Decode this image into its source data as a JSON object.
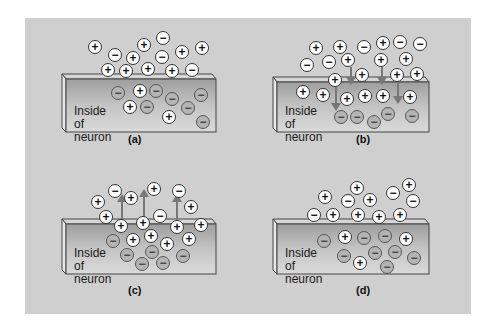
{
  "figure": {
    "background_color": "#cfcfcf",
    "membrane_color": "#b9b9b9",
    "arrow_color": "#777777"
  },
  "panels": [
    {
      "id": "a",
      "caption": "(a)",
      "inside_label_line1": "Inside",
      "inside_label_line2": "of neuron",
      "membrane": {
        "x": 66,
        "y": 77,
        "w": 146,
        "h": 54
      },
      "caption_pos": {
        "x": 136,
        "y": 140
      },
      "ions": [
        {
          "charge": "+",
          "region": "out",
          "x": 95,
          "y": 47
        },
        {
          "charge": "−",
          "region": "out",
          "x": 115,
          "y": 55
        },
        {
          "charge": "+",
          "region": "out",
          "x": 133,
          "y": 58
        },
        {
          "charge": "+",
          "region": "out",
          "x": 144,
          "y": 45
        },
        {
          "charge": "−",
          "region": "out",
          "x": 163,
          "y": 38
        },
        {
          "charge": "−",
          "region": "out",
          "x": 162,
          "y": 57
        },
        {
          "charge": "+",
          "region": "out",
          "x": 182,
          "y": 52
        },
        {
          "charge": "+",
          "region": "out",
          "x": 202,
          "y": 48
        },
        {
          "charge": "+",
          "region": "out",
          "x": 108,
          "y": 70
        },
        {
          "charge": "+",
          "region": "out",
          "x": 126,
          "y": 71
        },
        {
          "charge": "+",
          "region": "out",
          "x": 148,
          "y": 69
        },
        {
          "charge": "+",
          "region": "out",
          "x": 172,
          "y": 71
        },
        {
          "charge": "−",
          "region": "out",
          "x": 192,
          "y": 70
        },
        {
          "charge": "−",
          "region": "in",
          "x": 118,
          "y": 93
        },
        {
          "charge": "+",
          "region": "in",
          "x": 140,
          "y": 91
        },
        {
          "charge": "−",
          "region": "in",
          "x": 156,
          "y": 91
        },
        {
          "charge": "−",
          "region": "in",
          "x": 172,
          "y": 99
        },
        {
          "charge": "−",
          "region": "in",
          "x": 201,
          "y": 95
        },
        {
          "charge": "+",
          "region": "in",
          "x": 130,
          "y": 107
        },
        {
          "charge": "−",
          "region": "in",
          "x": 147,
          "y": 107
        },
        {
          "charge": "−",
          "region": "in",
          "x": 188,
          "y": 108
        },
        {
          "charge": "+",
          "region": "in",
          "x": 169,
          "y": 117
        },
        {
          "charge": "−",
          "region": "in",
          "x": 203,
          "y": 122
        }
      ],
      "arrows": []
    },
    {
      "id": "b",
      "caption": "(b)",
      "inside_label_line1": "Inside",
      "inside_label_line2": "of neuron",
      "membrane": {
        "x": 277,
        "y": 80,
        "w": 148,
        "h": 51
      },
      "caption_pos": {
        "x": 364,
        "y": 140
      },
      "ions": [
        {
          "charge": "+",
          "region": "out",
          "x": 316,
          "y": 48
        },
        {
          "charge": "+",
          "region": "out",
          "x": 340,
          "y": 47
        },
        {
          "charge": "−",
          "region": "out",
          "x": 364,
          "y": 47
        },
        {
          "charge": "+",
          "region": "out",
          "x": 383,
          "y": 43
        },
        {
          "charge": "−",
          "region": "out",
          "x": 400,
          "y": 42
        },
        {
          "charge": "−",
          "region": "out",
          "x": 420,
          "y": 44
        },
        {
          "charge": "−",
          "region": "out",
          "x": 307,
          "y": 65
        },
        {
          "charge": "−",
          "region": "out",
          "x": 329,
          "y": 62
        },
        {
          "charge": "+",
          "region": "out",
          "x": 348,
          "y": 60
        },
        {
          "charge": "+",
          "region": "out",
          "x": 381,
          "y": 60
        },
        {
          "charge": "+",
          "region": "out",
          "x": 406,
          "y": 59
        },
        {
          "charge": "+",
          "region": "out",
          "x": 362,
          "y": 75
        },
        {
          "charge": "+",
          "region": "out",
          "x": 397,
          "y": 75
        },
        {
          "charge": "+",
          "region": "out",
          "x": 417,
          "y": 74
        },
        {
          "charge": "+",
          "region": "out",
          "x": 335,
          "y": 80
        },
        {
          "charge": "+",
          "region": "in",
          "x": 303,
          "y": 92
        },
        {
          "charge": "+",
          "region": "in",
          "x": 323,
          "y": 95
        },
        {
          "charge": "+",
          "region": "in",
          "x": 347,
          "y": 99
        },
        {
          "charge": "+",
          "region": "in",
          "x": 365,
          "y": 96
        },
        {
          "charge": "+",
          "region": "in",
          "x": 383,
          "y": 96
        },
        {
          "charge": "+",
          "region": "in",
          "x": 410,
          "y": 97
        },
        {
          "charge": "−",
          "region": "in",
          "x": 341,
          "y": 117
        },
        {
          "charge": "−",
          "region": "in",
          "x": 357,
          "y": 117
        },
        {
          "charge": "−",
          "region": "in",
          "x": 374,
          "y": 122
        },
        {
          "charge": "−",
          "region": "in",
          "x": 388,
          "y": 114
        },
        {
          "charge": "−",
          "region": "in",
          "x": 412,
          "y": 116
        }
      ],
      "arrows": [
        {
          "dir": "down",
          "x": 335,
          "y": 87,
          "len": 18
        },
        {
          "dir": "down",
          "x": 350,
          "y": 67,
          "len": 12
        },
        {
          "dir": "down",
          "x": 381,
          "y": 67,
          "len": 12
        },
        {
          "dir": "down",
          "x": 397,
          "y": 82,
          "len": 16
        }
      ]
    },
    {
      "id": "c",
      "caption": "(c)",
      "inside_label_line1": "Inside",
      "inside_label_line2": "of neuron",
      "membrane": {
        "x": 66,
        "y": 222,
        "w": 146,
        "h": 51
      },
      "caption_pos": {
        "x": 136,
        "y": 291
      },
      "ions": [
        {
          "charge": "−",
          "region": "out",
          "x": 115,
          "y": 191
        },
        {
          "charge": "+",
          "region": "out",
          "x": 154,
          "y": 189
        },
        {
          "charge": "−",
          "region": "out",
          "x": 179,
          "y": 191
        },
        {
          "charge": "+",
          "region": "out",
          "x": 98,
          "y": 202
        },
        {
          "charge": "+",
          "region": "out",
          "x": 131,
          "y": 198
        },
        {
          "charge": "+",
          "region": "out",
          "x": 191,
          "y": 207
        },
        {
          "charge": "+",
          "region": "out",
          "x": 106,
          "y": 217
        },
        {
          "charge": "−",
          "region": "out",
          "x": 160,
          "y": 216
        },
        {
          "charge": "+",
          "region": "out",
          "x": 121,
          "y": 226
        },
        {
          "charge": "+",
          "region": "out",
          "x": 143,
          "y": 223
        },
        {
          "charge": "+",
          "region": "out",
          "x": 177,
          "y": 227
        },
        {
          "charge": "+",
          "region": "out",
          "x": 201,
          "y": 225
        },
        {
          "charge": "−",
          "region": "in",
          "x": 113,
          "y": 241
        },
        {
          "charge": "+",
          "region": "in",
          "x": 133,
          "y": 240
        },
        {
          "charge": "+",
          "region": "in",
          "x": 151,
          "y": 236
        },
        {
          "charge": "+",
          "region": "in",
          "x": 167,
          "y": 244
        },
        {
          "charge": "+",
          "region": "in",
          "x": 189,
          "y": 239
        },
        {
          "charge": "−",
          "region": "in",
          "x": 127,
          "y": 255
        },
        {
          "charge": "−",
          "region": "in",
          "x": 152,
          "y": 252
        },
        {
          "charge": "−",
          "region": "in",
          "x": 183,
          "y": 256
        },
        {
          "charge": "−",
          "region": "in",
          "x": 142,
          "y": 264
        },
        {
          "charge": "−",
          "region": "in",
          "x": 163,
          "y": 263
        }
      ],
      "arrows": [
        {
          "dir": "up",
          "x": 121,
          "y": 200,
          "len": 20
        },
        {
          "dir": "up",
          "x": 143,
          "y": 195,
          "len": 22
        },
        {
          "dir": "up",
          "x": 176,
          "y": 200,
          "len": 20
        }
      ]
    },
    {
      "id": "d",
      "caption": "(d)",
      "inside_label_line1": "Inside",
      "inside_label_line2": "of neuron",
      "membrane": {
        "x": 277,
        "y": 222,
        "w": 148,
        "h": 51
      },
      "caption_pos": {
        "x": 364,
        "y": 291
      },
      "ions": [
        {
          "charge": "+",
          "region": "out",
          "x": 357,
          "y": 188
        },
        {
          "charge": "+",
          "region": "out",
          "x": 409,
          "y": 185
        },
        {
          "charge": "+",
          "region": "out",
          "x": 325,
          "y": 197
        },
        {
          "charge": "−",
          "region": "out",
          "x": 348,
          "y": 201
        },
        {
          "charge": "+",
          "region": "out",
          "x": 370,
          "y": 200
        },
        {
          "charge": "−",
          "region": "out",
          "x": 393,
          "y": 193
        },
        {
          "charge": "−",
          "region": "out",
          "x": 413,
          "y": 201
        },
        {
          "charge": "−",
          "region": "out",
          "x": 314,
          "y": 215
        },
        {
          "charge": "+",
          "region": "out",
          "x": 333,
          "y": 215
        },
        {
          "charge": "+",
          "region": "out",
          "x": 358,
          "y": 215
        },
        {
          "charge": "+",
          "region": "out",
          "x": 379,
          "y": 217
        },
        {
          "charge": "+",
          "region": "out",
          "x": 400,
          "y": 215
        },
        {
          "charge": "−",
          "region": "in",
          "x": 324,
          "y": 241
        },
        {
          "charge": "+",
          "region": "in",
          "x": 345,
          "y": 237
        },
        {
          "charge": "−",
          "region": "in",
          "x": 364,
          "y": 238
        },
        {
          "charge": "−",
          "region": "in",
          "x": 385,
          "y": 236
        },
        {
          "charge": "+",
          "region": "in",
          "x": 406,
          "y": 239
        },
        {
          "charge": "−",
          "region": "in",
          "x": 344,
          "y": 256
        },
        {
          "charge": "−",
          "region": "in",
          "x": 375,
          "y": 253
        },
        {
          "charge": "−",
          "region": "in",
          "x": 395,
          "y": 252
        },
        {
          "charge": "−",
          "region": "in",
          "x": 414,
          "y": 258
        },
        {
          "charge": "+",
          "region": "in",
          "x": 360,
          "y": 263
        },
        {
          "charge": "−",
          "region": "in",
          "x": 387,
          "y": 267
        }
      ],
      "arrows": []
    }
  ]
}
